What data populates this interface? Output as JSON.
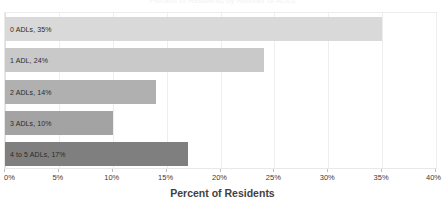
{
  "chart_data": {
    "type": "bar",
    "orientation": "horizontal",
    "title": "Percent of Residents by Number of ADLs",
    "xlabel": "Percent of Residents",
    "ylabel": "",
    "categories": [
      "0 ADLs",
      "1 ADL",
      "2 ADLs",
      "3 ADLs",
      "4 to 5 ADLs"
    ],
    "values": [
      35,
      24,
      14,
      10,
      17
    ],
    "data_labels": [
      "0 ADLs, 35%",
      "1 ADL, 24%",
      "2 ADLs, 14%",
      "3 ADLs, 10%",
      "4 to 5 ADLs, 17%"
    ],
    "bar_colors": [
      "#d9d9d9",
      "#c9c9c9",
      "#b0b0b0",
      "#a3a3a3",
      "#7f7f7f"
    ],
    "xlim": [
      0,
      40
    ],
    "xtick_labels": [
      "0%",
      "5%",
      "10%",
      "15%",
      "20%",
      "25%",
      "30%",
      "35%",
      "40%"
    ],
    "xtick_values": [
      0,
      5,
      10,
      15,
      20,
      25,
      30,
      35,
      40
    ],
    "grid": true,
    "grid_axis": "x",
    "legend": false,
    "legend_position": "none",
    "value_suffix": "%"
  },
  "axis": {
    "x_title": "Percent of Residents"
  },
  "colors": {
    "background": "#ffffff",
    "gridline": "#eceff1",
    "plot_border": "#e8e8e8",
    "tick_text": "#3a3a3a",
    "label_text": "#2b2b2b",
    "axis_title_text": "#3f3f3f"
  }
}
